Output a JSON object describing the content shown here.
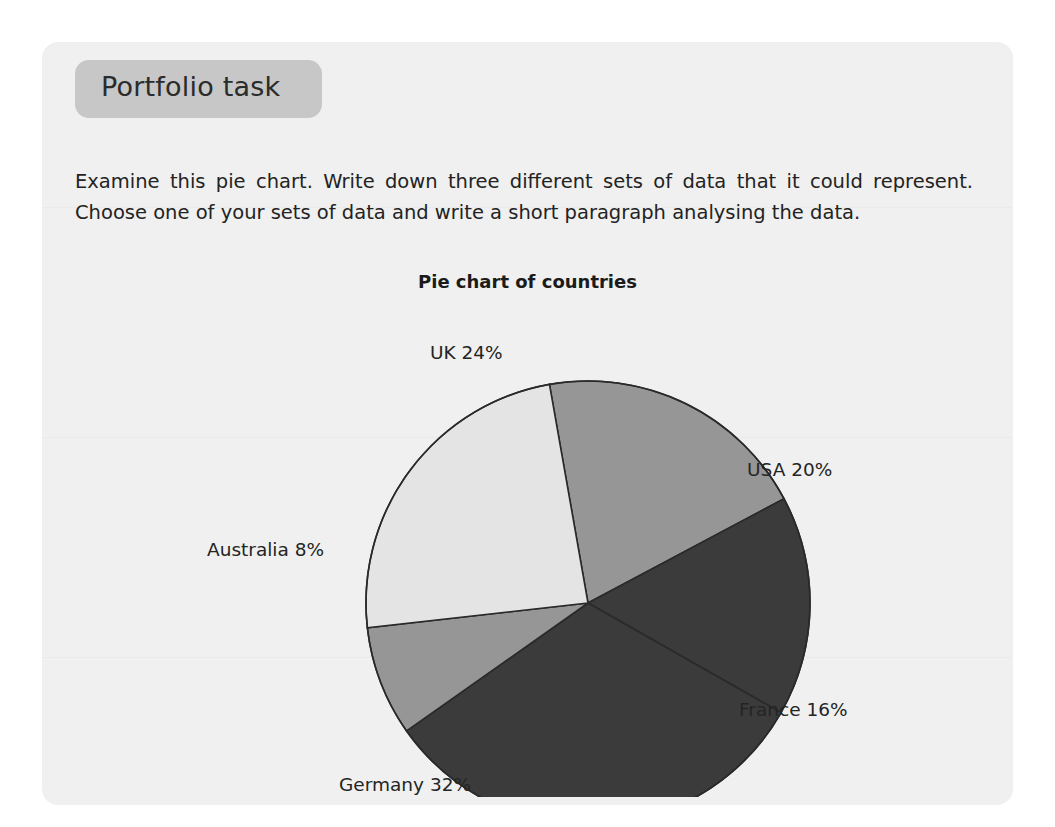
{
  "page": {
    "banner_label": "Portfolio task",
    "instructions": "Examine this pie chart. Write down three different sets of data that it could represent. Choose one of your sets of data and write a short paragraph analysing the data.",
    "background_color": "#eff0ef",
    "banner_color": "#c6c7c6"
  },
  "chart_data": {
    "type": "pie",
    "title": "Pie chart of countries",
    "xlabel": "",
    "ylabel": "",
    "legend_position": "none",
    "grid": false,
    "categories": [
      "USA",
      "France",
      "Germany",
      "Australia",
      "UK"
    ],
    "values": [
      20,
      16,
      32,
      8,
      24
    ],
    "unit": "%",
    "labels": [
      "USA 20%",
      "France 16%",
      "Germany 32%",
      "Australia 8%",
      "UK 24%"
    ],
    "slices": [
      {
        "name": "USA",
        "label": "USA 20%",
        "value": 20,
        "color": "#969696"
      },
      {
        "name": "France",
        "label": "France 16%",
        "value": 16,
        "color": "#3b3b3b"
      },
      {
        "name": "Germany",
        "label": "Germany 32%",
        "value": 32,
        "color": "#3b3b3b"
      },
      {
        "name": "Australia",
        "label": "Australia 8%",
        "value": 8,
        "color": "#969696"
      },
      {
        "name": "UK",
        "label": "UK 24%",
        "value": 24,
        "color": "#e3e4e3"
      }
    ],
    "start_angle_deg": -10,
    "direction": "clockwise",
    "outline_color": "#2a2a2a",
    "total": 100
  }
}
